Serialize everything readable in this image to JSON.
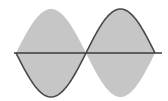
{
  "diagram": {
    "type": "sine-wave-with-envelope",
    "colors": {
      "background": "#ffffff",
      "envelope_fill": "#c6c6c6",
      "wave_stroke": "#4a4a4a",
      "axis_stroke": "#3a3a3a"
    },
    "axis": {
      "y": 53,
      "x_start": 14,
      "x_end": 162
    },
    "wave": {
      "x_start": 16,
      "x_mid": 86,
      "x_end": 155,
      "amplitude": 44,
      "first_half": "negative",
      "second_half": "positive"
    }
  }
}
